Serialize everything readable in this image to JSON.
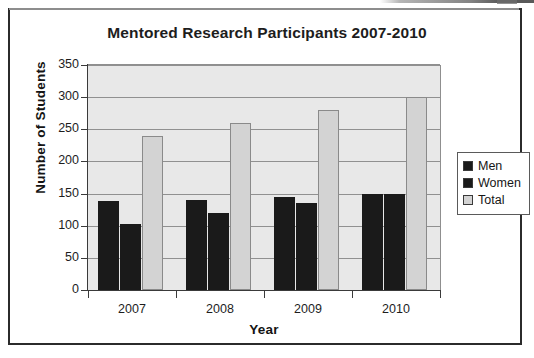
{
  "figure": {
    "title": "Mentored Research Participants 2007-2010"
  },
  "axes": {
    "y_title": "Number of Students",
    "x_title": "Year",
    "y_ticks": [
      "350",
      "300",
      "250",
      "200",
      "150",
      "100",
      "50",
      "0"
    ],
    "x_ticks": [
      "2007",
      "2008",
      "2009",
      "2010"
    ]
  },
  "legend": {
    "items": [
      {
        "label": "Men",
        "color": "#1a1a1a"
      },
      {
        "label": "Women",
        "color": "#1a1a1a"
      },
      {
        "label": "Total",
        "color": "#d3d3d3"
      }
    ]
  },
  "colors": {
    "men": "#1a1a1a",
    "women": "#1a1a1a",
    "total": "#d3d3d3",
    "plot_background": "#e8e8e8",
    "gridline": "#909090",
    "axis": "#3a3a3a",
    "frame": "#2b2b2b",
    "text": "#1d1d1d"
  },
  "chart_data": {
    "type": "bar",
    "title": "Mentored Research Participants 2007-2010",
    "subtitle": "",
    "xlabel": "Year",
    "ylabel": "Number of Students",
    "categories": [
      "2007",
      "2008",
      "2009",
      "2010"
    ],
    "series": [
      {
        "name": "Men",
        "values": [
          138,
          140,
          145,
          150
        ]
      },
      {
        "name": "Women",
        "values": [
          102,
          120,
          135,
          150
        ]
      },
      {
        "name": "Total",
        "values": [
          240,
          260,
          280,
          300
        ]
      }
    ],
    "ylim": [
      0,
      350
    ],
    "ytick_step": 50,
    "yticks": [
      0,
      50,
      100,
      150,
      200,
      250,
      300,
      350
    ],
    "grid": true,
    "grid_axis": "y",
    "legend_position": "right",
    "annotations": []
  }
}
